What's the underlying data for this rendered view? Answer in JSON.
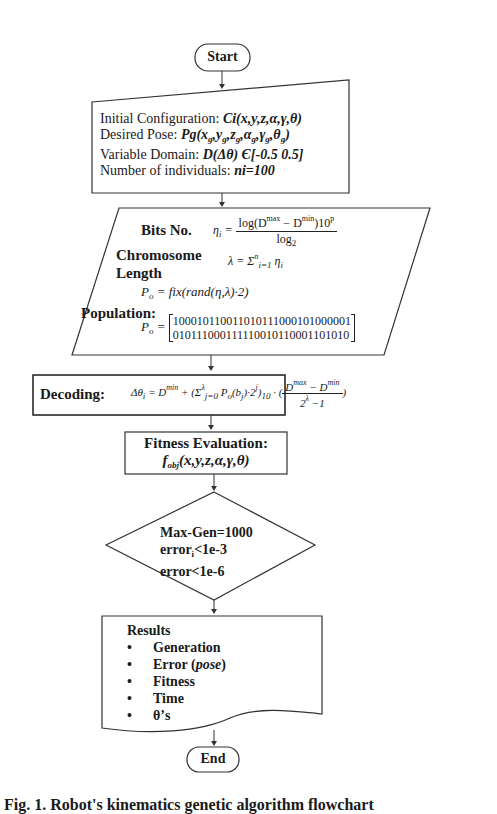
{
  "flowchart": {
    "start": {
      "label": "Start"
    },
    "config": {
      "lines": [
        {
          "label": "Initial Configuration: ",
          "value": "Ci(x,y,z,α,γ,θ)"
        },
        {
          "label": "Desired Pose: ",
          "value_pre": "Pg(x",
          "value_parts": [
            "g",
            ",y",
            "g",
            ",z",
            "g",
            ",α",
            "g",
            ",γ",
            "g",
            ",θ",
            "g",
            ")"
          ]
        },
        {
          "label": "Variable Domain: ",
          "value": "D(Δθ) Є[-0.5 0.5]"
        },
        {
          "label": "Number of individuals: ",
          "value": "ni=100"
        }
      ]
    },
    "encoding": {
      "bits_label": "Bits No.",
      "bits_eq_lhs": "η",
      "bits_eq_lhs_sub": "i",
      "bits_eq_num": "log(D",
      "bits_eq_num_sup1": "max",
      "bits_eq_num_mid": " − D",
      "bits_eq_num_sup2": "min",
      "bits_eq_num_end": ")10",
      "bits_eq_num_sup3": "p",
      "bits_eq_den": "log",
      "bits_eq_den_sub": "2",
      "chromosome_label_1": "Chromosome",
      "chromosome_label_2": "Length",
      "lambda_eq": "λ = Σ",
      "lambda_eq_sup": "n",
      "lambda_eq_sub": "i=1",
      "lambda_eq_end": " η",
      "lambda_eq_end_sub": "i",
      "population_gen_eq": "P",
      "population_gen_eq_sub": "o",
      "population_gen_eq_rhs": " = fix(rand(η,λ)·2)",
      "population_label": "Population:",
      "population_eq": "P",
      "population_eq_sub": "o",
      "population_eq_eq": " = ",
      "matrix_rows": [
        "100010110011010111000101000001",
        "010111000111110010110001101010"
      ]
    },
    "decoding": {
      "label": "Decoding:",
      "eq_a": "Δθ",
      "eq_a_sub": "i",
      "eq_b": " = D",
      "eq_b_sup": "min",
      "eq_c": " + (Σ",
      "eq_c_sup": "λ",
      "eq_c_sub": "j=0",
      "eq_d": " P",
      "eq_d_sub": "o",
      "eq_e": "(b",
      "eq_e_sub": "j",
      "eq_f": ")·2",
      "eq_f_sup": "j",
      "eq_g": ")",
      "eq_g_sub": "10",
      "eq_h": " · ",
      "frac_num": "D",
      "frac_num_sup1": "max",
      "frac_num_mid": " − D",
      "frac_num_sup2": "min",
      "frac_den": "2",
      "frac_den_sup": "λ",
      "frac_den_end": " −1"
    },
    "fitness": {
      "title": "Fitness Evaluation:",
      "func": "f",
      "func_sub": "obj",
      "func_args": "(x,y,z,α,γ,θ)"
    },
    "decision": {
      "lines": [
        "Max-Gen=1000",
        "error",
        "<1e-3",
        "error<1e-6"
      ],
      "line2_sub": "i"
    },
    "results": {
      "title": "Results",
      "items": [
        "Generation",
        "Error (",
        "pose",
        ")",
        "Fitness",
        "Time",
        "θ’s"
      ],
      "bullet": "•"
    },
    "end": {
      "label": "End"
    }
  },
  "caption": {
    "text": "Fig. 1.  Robot's kinematics genetic algorithm flowchart"
  }
}
